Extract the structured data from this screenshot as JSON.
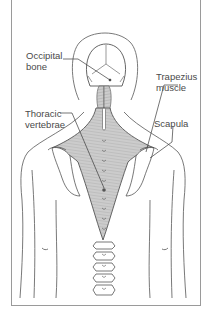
{
  "diagram": {
    "labels": [
      {
        "id": "occipital",
        "text": "Occipital\nbone"
      },
      {
        "id": "trapezius",
        "text": "Trapezius\nmuscle"
      },
      {
        "id": "thoracic",
        "text": "Thoracic\nvertebrae"
      },
      {
        "id": "scapula",
        "text": "Scapula"
      }
    ]
  },
  "colors": {
    "outline": "#5a5a5a",
    "muscle_fill": "#c9c9c9",
    "muscle_fiber": "#9a9a9a",
    "frame": "#9a9a9a",
    "label_text": "#4a4a4a",
    "background": "#ffffff"
  }
}
